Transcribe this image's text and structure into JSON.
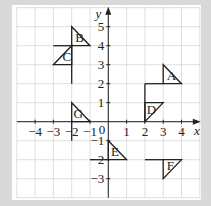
{
  "diagram": {
    "axes": {
      "x_label": "x",
      "y_label": "y",
      "origin_label": "0",
      "x_ticks": [
        {
          "value": -4,
          "label": "−4"
        },
        {
          "value": -3,
          "label": "−3"
        },
        {
          "value": -2,
          "label": "−2"
        },
        {
          "value": -1,
          "label": "−1"
        },
        {
          "value": 1,
          "label": "1"
        },
        {
          "value": 2,
          "label": "2"
        },
        {
          "value": 3,
          "label": "3"
        },
        {
          "value": 4,
          "label": "4"
        }
      ],
      "y_ticks": [
        {
          "value": 5,
          "label": "5"
        },
        {
          "value": 4,
          "label": "4"
        },
        {
          "value": 3,
          "label": "3"
        },
        {
          "value": 2,
          "label": "2"
        },
        {
          "value": 1,
          "label": "1"
        },
        {
          "value": -1,
          "label": "−1"
        },
        {
          "value": -2,
          "label": "−2"
        },
        {
          "value": -3,
          "label": "−3"
        }
      ],
      "x_range": [
        -5,
        5
      ],
      "y_range": [
        -4,
        6
      ]
    },
    "shapes": [
      {
        "label": "A",
        "points": [
          [
            3,
            2
          ],
          [
            4,
            2
          ],
          [
            3,
            3
          ]
        ],
        "label_pos": [
          3.2,
          2.2
        ]
      },
      {
        "label": "B",
        "points": [
          [
            -2,
            4
          ],
          [
            -1,
            4
          ],
          [
            -2,
            5
          ]
        ],
        "label_pos": [
          -1.8,
          4.2
        ]
      },
      {
        "label": "C",
        "points": [
          [
            -2,
            3
          ],
          [
            -3,
            3
          ],
          [
            -2,
            4
          ]
        ],
        "label_pos": [
          -2.5,
          3.2
        ]
      },
      {
        "label": "D",
        "points": [
          [
            2,
            0
          ],
          [
            2,
            1
          ],
          [
            3,
            1
          ]
        ],
        "label_pos": [
          2.1,
          0.4
        ]
      },
      {
        "label": "E",
        "points": [
          [
            0,
            -2
          ],
          [
            1,
            -2
          ],
          [
            0,
            -1
          ]
        ],
        "label_pos": [
          0.15,
          -1.8
        ]
      },
      {
        "label": "F",
        "points": [
          [
            3,
            -2
          ],
          [
            4,
            -2
          ],
          [
            3,
            -3
          ]
        ],
        "label_pos": [
          3.2,
          -2.55
        ]
      },
      {
        "label": "G",
        "points": [
          [
            -2,
            0
          ],
          [
            -1,
            0
          ],
          [
            -2,
            1
          ]
        ],
        "label_pos": [
          -1.9,
          0.2
        ]
      }
    ],
    "lines": [
      [
        [
          2,
          2
        ],
        [
          3,
          2
        ]
      ],
      [
        [
          2,
          2
        ],
        [
          2,
          0
        ]
      ],
      [
        [
          -3,
          4
        ],
        [
          -2,
          4
        ]
      ],
      [
        [
          -2,
          4
        ],
        [
          -2,
          2
        ]
      ],
      [
        [
          -2,
          0
        ],
        [
          -2,
          -1
        ]
      ],
      [
        [
          -1,
          -2
        ],
        [
          0,
          -2
        ]
      ],
      [
        [
          2,
          -2
        ],
        [
          3,
          -2
        ]
      ]
    ],
    "colors": {
      "background": "#d9d9d9",
      "panel": "#ffffff",
      "grid": "#d6d6d6",
      "ink": "#222222"
    }
  }
}
